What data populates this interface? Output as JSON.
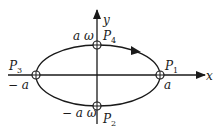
{
  "diagram": {
    "type": "phase-space ellipse",
    "axes": {
      "x_label": "x",
      "y_label": "y"
    },
    "points": [
      {
        "id": "P1",
        "label": "P",
        "sub": "1",
        "value_label": "a"
      },
      {
        "id": "P2",
        "label": "P",
        "sub": "2",
        "value_label": "− a ω"
      },
      {
        "id": "P3",
        "label": "P",
        "sub": "3",
        "value_label": "− a"
      },
      {
        "id": "P4",
        "label": "P",
        "sub": "4",
        "value_label": "a ω"
      }
    ],
    "direction": "clockwise",
    "colors": {
      "stroke": "#1a1a1a",
      "background": "#ffffff"
    }
  }
}
